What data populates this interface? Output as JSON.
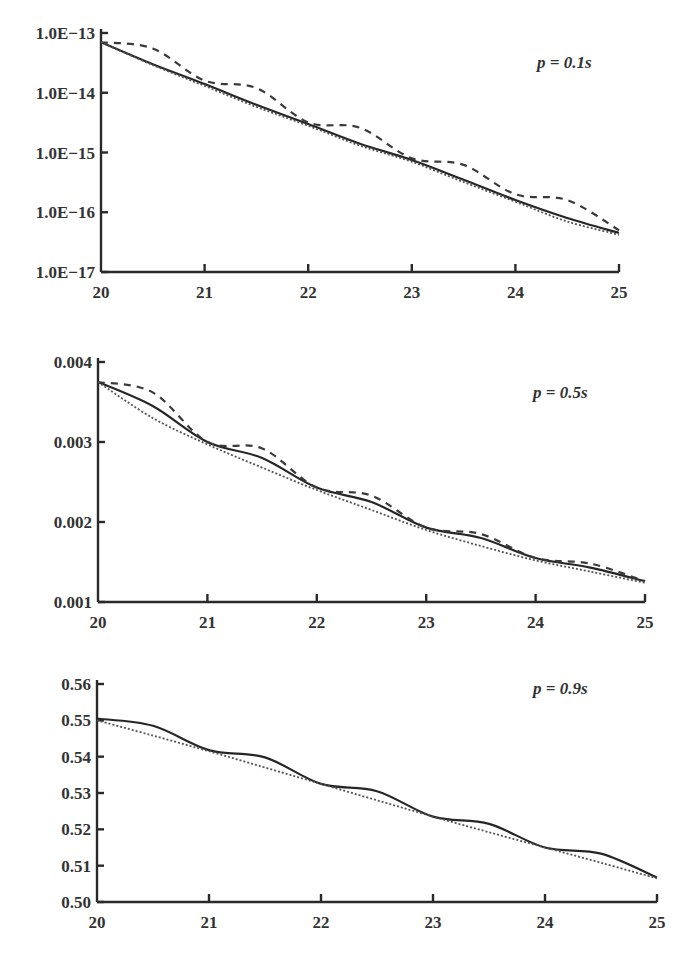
{
  "chart_data": [
    {
      "type": "line",
      "title": "",
      "annotation": "p = 0.1s",
      "xlabel": "",
      "ylabel": "",
      "yscale": "log",
      "xlim": [
        20,
        25
      ],
      "ylim": [
        1e-17,
        1e-13
      ],
      "x_ticks": [
        "20",
        "21",
        "22",
        "23",
        "24",
        "25"
      ],
      "y_ticks": [
        "1.0E−13",
        "1.0E−14",
        "1.0E−15",
        "1.0E−16",
        "1.0E−17"
      ],
      "grid": false,
      "legend": null,
      "x": [
        20,
        20.5,
        21,
        21.5,
        22,
        22.5,
        23,
        23.5,
        24,
        24.5,
        25
      ],
      "series": [
        {
          "name": "solid",
          "style": "solid",
          "values": [
            7e-14,
            3e-14,
            1.4e-14,
            6.3e-15,
            3e-15,
            1.4e-15,
            7.5e-16,
            3.5e-16,
            1.6e-16,
            8e-17,
            4.5e-17
          ]
        },
        {
          "name": "dashed",
          "style": "dashed",
          "values": [
            7e-14,
            5.5e-14,
            1.6e-14,
            1.2e-14,
            3.2e-15,
            2.6e-15,
            8e-16,
            6.2e-16,
            2e-16,
            1.6e-16,
            5e-17
          ]
        },
        {
          "name": "dotted",
          "style": "dotted",
          "values": [
            7e-14,
            2.9e-14,
            1.3e-14,
            5.8e-15,
            2.8e-15,
            1.3e-15,
            7e-16,
            3.2e-16,
            1.5e-16,
            7e-17,
            4.2e-17
          ]
        }
      ]
    },
    {
      "type": "line",
      "title": "",
      "annotation": "p = 0.5s",
      "xlabel": "",
      "ylabel": "",
      "yscale": "linear",
      "xlim": [
        20,
        25
      ],
      "ylim": [
        0.001,
        0.004
      ],
      "x_ticks": [
        "20",
        "21",
        "22",
        "23",
        "24",
        "25"
      ],
      "y_ticks": [
        "0.004",
        "0.003",
        "0.002",
        "0.001"
      ],
      "grid": false,
      "legend": null,
      "x": [
        20,
        20.5,
        21,
        21.5,
        22,
        22.5,
        23,
        23.5,
        24,
        24.5,
        25
      ],
      "series": [
        {
          "name": "solid",
          "style": "solid",
          "values": [
            0.00375,
            0.00345,
            0.003,
            0.0028,
            0.00243,
            0.00225,
            0.00193,
            0.0018,
            0.00155,
            0.00143,
            0.00126
          ]
        },
        {
          "name": "dashed",
          "style": "dashed",
          "values": [
            0.00375,
            0.00362,
            0.003,
            0.00292,
            0.00243,
            0.00233,
            0.00193,
            0.00185,
            0.00155,
            0.00148,
            0.00126
          ]
        },
        {
          "name": "dotted",
          "style": "dotted",
          "values": [
            0.00375,
            0.0033,
            0.00297,
            0.00268,
            0.0024,
            0.00215,
            0.0019,
            0.0017,
            0.00152,
            0.00138,
            0.00124
          ]
        }
      ]
    },
    {
      "type": "line",
      "title": "",
      "annotation": "p = 0.9s",
      "xlabel": "",
      "ylabel": "",
      "yscale": "linear",
      "xlim": [
        20,
        25
      ],
      "ylim": [
        0.5,
        0.56
      ],
      "x_ticks": [
        "20",
        "21",
        "22",
        "23",
        "24",
        "25"
      ],
      "y_ticks": [
        "0.56",
        "0.55",
        "0.54",
        "0.53",
        "0.52",
        "0.51",
        "0.50"
      ],
      "grid": false,
      "legend": null,
      "x": [
        20,
        20.5,
        21,
        21.5,
        22,
        22.5,
        23,
        23.5,
        24,
        24.5,
        25
      ],
      "series": [
        {
          "name": "solid",
          "style": "solid",
          "values": [
            0.5505,
            0.5485,
            0.5418,
            0.5398,
            0.5325,
            0.5305,
            0.5235,
            0.5215,
            0.515,
            0.5133,
            0.5067
          ]
        },
        {
          "name": "dotted",
          "style": "dotted",
          "values": [
            0.55,
            0.5458,
            0.5415,
            0.537,
            0.5325,
            0.528,
            0.5235,
            0.5192,
            0.515,
            0.5108,
            0.5065
          ]
        }
      ]
    }
  ]
}
